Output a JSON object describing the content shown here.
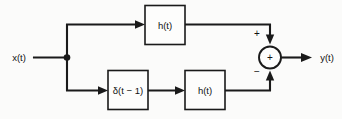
{
  "diagram": {
    "kind": "signal-flow-block-diagram",
    "title": "",
    "background_color": "#fbfbfa",
    "line_color": "#1a1a1a",
    "text_color": "#111111",
    "input": {
      "label": "x(t)",
      "name": "input-signal"
    },
    "output": {
      "label": "y(t)",
      "name": "output-signal"
    },
    "blocks": [
      {
        "id": "top-impulse-response",
        "label": "h(t)",
        "branch": "top"
      },
      {
        "id": "delay-delta",
        "label": "δ(t − 1)",
        "branch": "bottom"
      },
      {
        "id": "bottom-impulse-response",
        "label": "h(t)",
        "branch": "bottom"
      }
    ],
    "summing_junction": {
      "name": "summing-junction",
      "inner_symbol": "+",
      "top_input_sign": "+",
      "bottom_input_sign": "−"
    }
  }
}
